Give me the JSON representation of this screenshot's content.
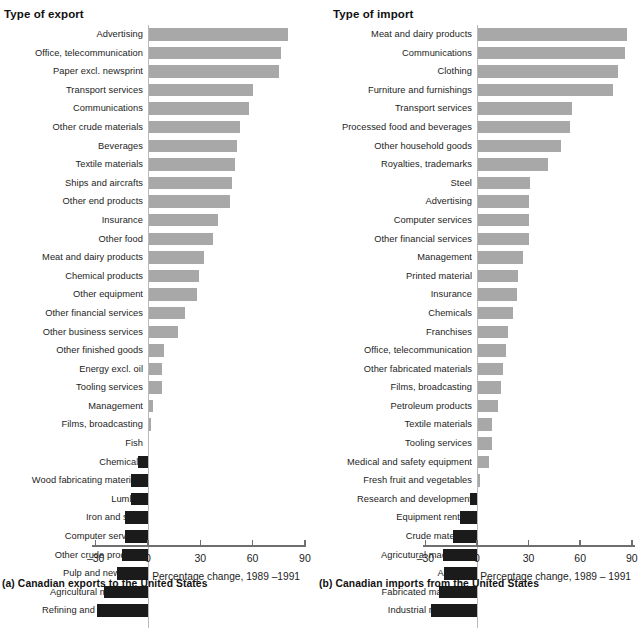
{
  "figure": {
    "panels": [
      {
        "id": "a",
        "title": "Type of export",
        "caption": "(a) Canadian exports to the United States",
        "axis_title": "Percentage change, 1989 –1991",
        "tick_labels": [
          "–30",
          "0",
          "30",
          "60",
          "90"
        ]
      },
      {
        "id": "b",
        "title": "Type of import",
        "caption": "(b) Canadian imports from the United States",
        "axis_title": "Percentage change, 1989 – 1991",
        "tick_labels": [
          "–30",
          "0",
          "30",
          "60",
          "90"
        ]
      }
    ]
  },
  "colors": {
    "positive_bar": "#a8a8a8",
    "negative_bar": "#1b1b1b",
    "axis": "#6f6f6f",
    "zero_line": "#b9b9b9",
    "text": "#1d1d1d"
  },
  "chart_data": [
    {
      "type": "bar",
      "orientation": "horizontal",
      "title": "Type of export",
      "subtitle": "(a) Canadian exports to the United States",
      "xlabel": "Percentage change, 1989 –1991",
      "ylabel": "Type of export",
      "xlim": [
        -40,
        90
      ],
      "xticks": [
        -30,
        0,
        30,
        60,
        90
      ],
      "grid": false,
      "legend": null,
      "categories": [
        "Advertising",
        "Office, telecommunication",
        "Paper excl. newsprint",
        "Transport services",
        "Communications",
        "Other crude materials",
        "Beverages",
        "Textile materials",
        "Ships and aircrafts",
        "Other end products",
        "Insurance",
        "Other food",
        "Meat and dairy products",
        "Chemical products",
        "Other equipment",
        "Other financial services",
        "Other business services",
        "Other finished goods",
        "Energy excl. oil",
        "Tooling services",
        "Management",
        "Films, broadcasting",
        "Fish",
        "Chemicals",
        "Wood fabricating materials",
        "Lumber",
        "Iron and steel",
        "Computer services",
        "Other crude products",
        "Pulp and newsprint",
        "Agricultural machinery",
        "Refining and processing"
      ],
      "values": [
        80,
        76,
        75,
        60,
        58,
        53,
        51,
        50,
        48,
        47,
        40,
        37,
        32,
        29,
        28,
        21,
        17,
        9,
        8,
        8,
        3,
        2,
        0,
        -6,
        -10,
        -10,
        -13,
        -13,
        -15,
        -18,
        -25,
        -29
      ]
    },
    {
      "type": "bar",
      "orientation": "horizontal",
      "title": "Type of import",
      "subtitle": "(b) Canadian imports from the United States",
      "xlabel": "Percentage change, 1989 – 1991",
      "ylabel": "Type of import",
      "xlim": [
        -40,
        90
      ],
      "xticks": [
        -30,
        0,
        30,
        60,
        90
      ],
      "grid": false,
      "legend": null,
      "categories": [
        "Meat and dairy products",
        "Communications",
        "Clothing",
        "Furniture and furnishings",
        "Transport services",
        "Processed food and beverages",
        "Other household goods",
        "Royalties, trademarks",
        "Steel",
        "Advertising",
        "Computer services",
        "Other financial services",
        "Management",
        "Printed material",
        "Insurance",
        "Chemicals",
        "Franchises",
        "Office, telecommunication",
        "Other fabricated materials",
        "Films, broadcasting",
        "Petroleum products",
        "Textile materials",
        "Tooling services",
        "Medical and safety equipment",
        "Fresh fruit and vegetables",
        "Research and development",
        "Equipment rentals",
        "Crude materials",
        "Agricutural machinery",
        "Aircrafts",
        "Fabricated machinery",
        "Industrial machinery"
      ],
      "values": [
        87,
        86,
        82,
        79,
        55,
        54,
        49,
        41,
        31,
        30,
        30,
        30,
        27,
        24,
        23,
        21,
        18,
        17,
        15,
        14,
        12,
        9,
        9,
        7,
        2,
        -4,
        -10,
        -14,
        -20,
        -19,
        -22,
        -27
      ]
    }
  ]
}
